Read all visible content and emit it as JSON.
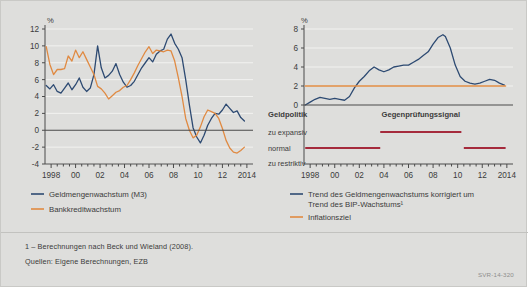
{
  "figure": {
    "background_color": "#dededc",
    "series_color_blue": "#2d4a72",
    "series_color_orange": "#e08a42",
    "signal_color_red": "#a52a3c",
    "axis_color": "#4a4a4a",
    "grid_color": "#f2f2f0"
  },
  "footnotes": {
    "note1": "1 – Berechnungen nach Beck und Wieland (2008).",
    "sources": "Quellen: Eigene Berechnungen, EZB",
    "code": "SVR-14-320"
  },
  "chart_data": [
    {
      "type": "line",
      "id": "left",
      "title": "",
      "ylabel": "%",
      "xlabel": "",
      "ylim": [
        -4,
        12
      ],
      "yticks": [
        -4,
        -2,
        0,
        2,
        4,
        6,
        8,
        10,
        12
      ],
      "ytick_labels": [
        "-4",
        "-2",
        "0",
        "2",
        "4",
        "6",
        "8",
        "10",
        "12"
      ],
      "xlim": [
        1997.5,
        2014.5
      ],
      "xticks": [
        1998,
        2000,
        2002,
        2004,
        2006,
        2008,
        2010,
        2012,
        2014
      ],
      "xtick_labels": [
        "1998",
        "00",
        "02",
        "04",
        "06",
        "08",
        "10",
        "12",
        "2014"
      ],
      "grid": true,
      "legend_position": "below",
      "series": [
        {
          "name": "Geldmengenwachstum (M3)",
          "color": "#2d4a72",
          "x": [
            1997.6,
            1997.9,
            1998.2,
            1998.5,
            1998.8,
            1999.1,
            1999.4,
            1999.7,
            2000.0,
            2000.3,
            2000.6,
            2000.9,
            2001.2,
            2001.5,
            2001.8,
            2002.1,
            2002.4,
            2002.7,
            2003.0,
            2003.3,
            2003.6,
            2003.9,
            2004.2,
            2004.5,
            2004.8,
            2005.1,
            2005.4,
            2005.7,
            2006.0,
            2006.3,
            2006.6,
            2006.9,
            2007.2,
            2007.5,
            2007.8,
            2008.1,
            2008.4,
            2008.7,
            2009.0,
            2009.3,
            2009.6,
            2009.9,
            2010.2,
            2010.5,
            2010.8,
            2011.1,
            2011.4,
            2011.7,
            2012.0,
            2012.3,
            2012.6,
            2012.9,
            2013.2,
            2013.5,
            2013.8
          ],
          "y": [
            5.3,
            4.9,
            5.4,
            4.6,
            4.4,
            5.0,
            5.6,
            4.8,
            5.4,
            6.2,
            5.1,
            4.6,
            5.0,
            6.6,
            10.0,
            7.4,
            6.2,
            6.5,
            7.0,
            7.9,
            6.6,
            5.7,
            5.1,
            5.3,
            5.8,
            6.6,
            7.4,
            8.0,
            8.6,
            8.1,
            9.0,
            9.4,
            9.6,
            10.8,
            11.4,
            10.3,
            9.6,
            8.6,
            6.0,
            3.0,
            0.3,
            -0.8,
            -1.5,
            -0.6,
            0.6,
            1.4,
            2.0,
            1.9,
            2.4,
            3.1,
            2.6,
            2.1,
            2.3,
            1.5,
            1.1
          ]
        },
        {
          "name": "Bankkreditwachstum",
          "color": "#e08a42",
          "x": [
            1997.6,
            1997.9,
            1998.2,
            1998.5,
            1998.8,
            1999.1,
            1999.4,
            1999.7,
            2000.0,
            2000.3,
            2000.6,
            2000.9,
            2001.2,
            2001.5,
            2001.8,
            2002.1,
            2002.4,
            2002.7,
            2003.0,
            2003.3,
            2003.6,
            2003.9,
            2004.2,
            2004.5,
            2004.8,
            2005.1,
            2005.4,
            2005.7,
            2006.0,
            2006.3,
            2006.6,
            2006.9,
            2007.2,
            2007.5,
            2007.8,
            2008.1,
            2008.4,
            2008.7,
            2009.0,
            2009.3,
            2009.6,
            2009.9,
            2010.2,
            2010.5,
            2010.8,
            2011.1,
            2011.4,
            2011.7,
            2012.0,
            2012.3,
            2012.6,
            2012.9,
            2013.2,
            2013.5,
            2013.8
          ],
          "y": [
            9.9,
            7.8,
            6.6,
            7.2,
            7.2,
            7.3,
            8.8,
            8.2,
            9.5,
            8.6,
            9.3,
            8.4,
            7.5,
            6.6,
            5.2,
            4.9,
            4.4,
            3.7,
            4.1,
            4.5,
            4.7,
            5.1,
            5.3,
            6.0,
            6.8,
            7.7,
            8.5,
            9.3,
            9.9,
            9.1,
            9.5,
            9.4,
            9.3,
            9.5,
            9.4,
            8.2,
            6.2,
            4.0,
            1.4,
            0.0,
            -0.9,
            -0.6,
            0.4,
            1.6,
            2.4,
            2.2,
            2.0,
            1.4,
            0.2,
            -1.2,
            -2.1,
            -2.6,
            -2.7,
            -2.4,
            -2.0
          ]
        }
      ]
    },
    {
      "type": "line",
      "id": "right",
      "title": "",
      "ylabel": "%",
      "xlabel": "",
      "ylim": [
        0,
        8
      ],
      "yticks": [
        0,
        2,
        4,
        6,
        8
      ],
      "ytick_labels": [
        "0",
        "2",
        "4",
        "6",
        "8"
      ],
      "xlim": [
        1997.5,
        2014.5
      ],
      "xticks": [
        1998,
        2000,
        2002,
        2004,
        2006,
        2008,
        2010,
        2012,
        2014
      ],
      "xtick_labels": [
        "1998",
        "00",
        "02",
        "04",
        "06",
        "08",
        "10",
        "12",
        "2014"
      ],
      "grid": true,
      "legend_position": "below",
      "series": [
        {
          "name": "Trend des Geldmengenwachstums korrigiert um Trend des BIP-Wachstums¹",
          "name_line1": "Trend des Geldmengenwachstums korrigiert um",
          "name_line2": "Trend des BIP-Wachstums¹",
          "color": "#2d4a72",
          "x": [
            1997.6,
            1998.0,
            1998.4,
            1998.8,
            1999.2,
            1999.6,
            2000.0,
            2000.4,
            2000.8,
            2001.2,
            2001.6,
            2002.0,
            2002.4,
            2002.8,
            2003.2,
            2003.6,
            2004.0,
            2004.4,
            2004.8,
            2005.2,
            2005.6,
            2006.0,
            2006.4,
            2006.8,
            2007.2,
            2007.6,
            2008.0,
            2008.4,
            2008.8,
            2009.0,
            2009.4,
            2009.8,
            2010.2,
            2010.6,
            2011.0,
            2011.4,
            2011.8,
            2012.2,
            2012.6,
            2013.0,
            2013.4,
            2013.8
          ],
          "y": [
            0.0,
            0.3,
            0.6,
            0.8,
            0.7,
            0.6,
            0.7,
            0.6,
            0.5,
            0.9,
            1.8,
            2.5,
            3.0,
            3.6,
            4.0,
            3.7,
            3.5,
            3.7,
            4.0,
            4.1,
            4.2,
            4.2,
            4.5,
            4.8,
            5.2,
            5.6,
            6.4,
            7.1,
            7.4,
            7.2,
            6.0,
            4.2,
            3.0,
            2.5,
            2.3,
            2.2,
            2.3,
            2.5,
            2.7,
            2.6,
            2.3,
            2.1
          ]
        },
        {
          "name": "Inflationsziel",
          "color": "#e08a42",
          "x": [
            1997.6,
            2013.9
          ],
          "y": [
            2.0,
            2.0
          ]
        }
      ],
      "signal_panel": {
        "title": "Geldpolitik",
        "overlay_label": "Gegenprüfungssignal",
        "categories": [
          "zu expansiv",
          "normal",
          "zu restriktiv"
        ],
        "bars": [
          {
            "category": "zu expansiv",
            "x_start": 2003.7,
            "x_end": 2010.3,
            "color": "#a52a3c"
          },
          {
            "category": "normal",
            "x_start": 1997.6,
            "x_end": 2003.7,
            "color": "#a52a3c"
          },
          {
            "category": "normal",
            "x_start": 2010.5,
            "x_end": 2013.9,
            "color": "#a52a3c"
          }
        ]
      }
    }
  ]
}
